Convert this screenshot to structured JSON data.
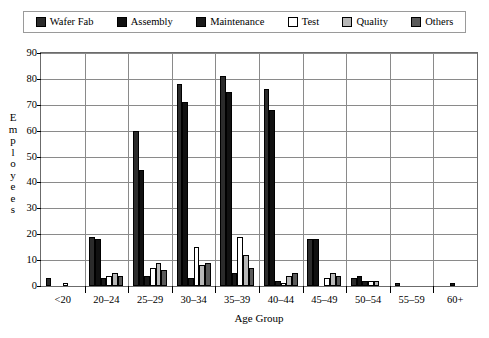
{
  "chart_data": {
    "type": "bar",
    "title": "",
    "xlabel": "Age Group",
    "ylabel": "Employees",
    "ylim": [
      0,
      90
    ],
    "yticks": [
      0,
      10,
      20,
      30,
      40,
      50,
      60,
      70,
      80,
      90
    ],
    "grid": "horizontal-and-vertical",
    "legend_position": "top",
    "categories": [
      "<20",
      "20–24",
      "25–29",
      "30–34",
      "35–39",
      "40–44",
      "45–49",
      "50–54",
      "55–59",
      "60+"
    ],
    "series": [
      {
        "name": "Wafer Fab",
        "color": "#2b2b2b",
        "values": [
          3,
          19,
          60,
          78,
          81,
          76,
          18,
          3,
          1,
          0
        ]
      },
      {
        "name": "Assembly",
        "color": "#111111",
        "values": [
          0,
          18,
          45,
          71,
          75,
          68,
          18,
          4,
          0,
          0
        ]
      },
      {
        "name": "Maintenance",
        "color": "#1a1a1a",
        "values": [
          0,
          3,
          4,
          3,
          5,
          2,
          0,
          2,
          0,
          1
        ]
      },
      {
        "name": "Test",
        "color": "#ffffff",
        "values": [
          1,
          4,
          7,
          15,
          19,
          1,
          3,
          2,
          0,
          0
        ]
      },
      {
        "name": "Quality",
        "color": "#b7b7b7",
        "values": [
          0,
          5,
          9,
          8,
          12,
          4,
          5,
          2,
          0,
          0
        ]
      },
      {
        "name": "Others",
        "color": "#5a5a5a",
        "values": [
          0,
          4,
          6,
          9,
          7,
          5,
          4,
          0,
          0,
          0
        ]
      }
    ]
  },
  "legend": {
    "items": [
      {
        "label": "Wafer Fab"
      },
      {
        "label": "Assembly"
      },
      {
        "label": "Maintenance"
      },
      {
        "label": "Test"
      },
      {
        "label": "Quality"
      },
      {
        "label": "Others"
      }
    ]
  }
}
